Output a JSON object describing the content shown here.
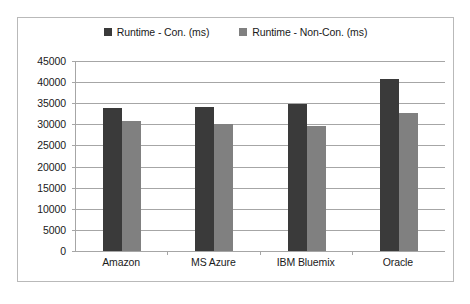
{
  "chart_data": {
    "type": "bar",
    "title": "",
    "xlabel": "",
    "ylabel": "",
    "categories": [
      "Amazon",
      "MS Azure",
      "IBM Bluemix",
      "Oracle"
    ],
    "series": [
      {
        "name": "Runtime - Con. (ms)",
        "color": "#3a3a3a",
        "values": [
          33800,
          34200,
          34800,
          40800
        ]
      },
      {
        "name": "Runtime - Non-Con. (ms)",
        "color": "#808080",
        "values": [
          30700,
          30000,
          29700,
          32700
        ]
      }
    ],
    "ylim": [
      0,
      45000
    ],
    "ytick_step": 5000,
    "yticks": [
      "45000",
      "40000",
      "35000",
      "30000",
      "25000",
      "20000",
      "15000",
      "10000",
      "5000",
      "0"
    ],
    "grid": true,
    "legend_position": "top-center"
  },
  "legend": {
    "entries": [
      {
        "label": "Runtime - Con. (ms)",
        "color": "#3a3a3a"
      },
      {
        "label": "Runtime - Non-Con. (ms)",
        "color": "#808080"
      }
    ]
  },
  "colors": {
    "series_con": "#3a3a3a",
    "series_noncon": "#808080",
    "axis": "#a6a6a6",
    "frame_border": "#b9b9b9",
    "background": "#ffffff"
  }
}
